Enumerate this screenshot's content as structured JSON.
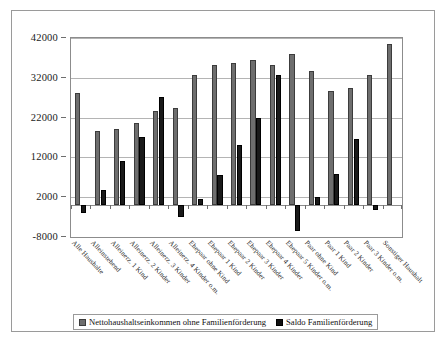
{
  "chart_data": {
    "type": "bar",
    "title": "",
    "xlabel": "",
    "ylabel": "",
    "ylim": [
      -8000,
      42000
    ],
    "ytick_labels": [
      "42000",
      "32000",
      "22000",
      "12000",
      "2000",
      "-8000"
    ],
    "yticks": [
      42000,
      32000,
      22000,
      12000,
      2000,
      -8000
    ],
    "grid": true,
    "legend_position": "bottom",
    "categories": [
      "Alle Haushalte",
      "Alleinstehend",
      "Alleinerz. 1 Kind",
      "Alleinerz. 2 Kinder",
      "Alleinerz. 3 Kinder",
      "Alleinerz. 4 Kinder o.m.",
      "Ehepaar ohne Kind",
      "Ehepaar 1 Kind",
      "Ehepaar 2 Kinder",
      "Ehepaar 3 Kinder",
      "Ehepaar 4 Kinder",
      "Ehepaar 5 Kinder o.m.",
      "Paar ohne Kind",
      "Paar 1 Kind",
      "Paar 2 Kinder",
      "Paar 3 Kinder o.m.",
      "Sonstiger Haushalt"
    ],
    "series": [
      {
        "name": "Nettohaushaltseinkommen ohne Familienförderung",
        "color": "#6e6e6e",
        "values": [
          28200,
          18600,
          19200,
          20600,
          23600,
          24500,
          32700,
          35100,
          35600,
          36500,
          35100,
          38000,
          33800,
          28700,
          29500,
          32700,
          40500
        ]
      },
      {
        "name": "Saldo Familienförderung",
        "color": "#1a1a1a",
        "values": [
          -1900,
          3900,
          11100,
          17100,
          27300,
          -2900,
          1600,
          7600,
          15100,
          22000,
          32600,
          -6500,
          2000,
          7800,
          16700,
          -1100,
          0
        ]
      }
    ]
  },
  "legend": {
    "items": [
      {
        "label": "Nettohaushaltseinkommen ohne Familienförderung",
        "swatch": "legend-swatch-net"
      },
      {
        "label": "Saldo Familienförderung",
        "swatch": "legend-swatch-saldo"
      }
    ]
  }
}
